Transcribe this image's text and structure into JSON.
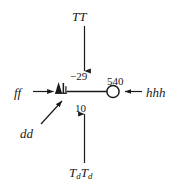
{
  "diagram": {
    "type": "signal-flow-block-diagram",
    "background_color": "#ffffff",
    "stroke_color": "#1a1a1a",
    "nodes": {
      "valve": {
        "name": "valve-symbol",
        "shape": "filled-triangle-with-bars",
        "x": 60,
        "y": 91
      },
      "summing_junction": {
        "name": "summing-junction",
        "shape": "open-circle",
        "x": 113,
        "y": 91,
        "radius": 6
      }
    },
    "labels": {
      "top_input": "TT",
      "left_input": "ff",
      "right_input": "hhh",
      "bottom_input_T": "T",
      "bottom_input_sub": "d",
      "diagonal_label": "dd"
    },
    "values": {
      "top_value": "−29",
      "bottom_value": "10",
      "node_value": "540"
    },
    "arrows": [
      {
        "name": "arrow-top-down",
        "from": "TT",
        "to": "main-line",
        "direction": "down"
      },
      {
        "name": "arrow-left-right",
        "from": "ff",
        "to": "valve",
        "direction": "right"
      },
      {
        "name": "arrow-right-left",
        "from": "hhh",
        "to": "summing-junction",
        "direction": "left"
      },
      {
        "name": "arrow-bottom-up",
        "from": "TdTd",
        "to": "main-line",
        "direction": "up"
      },
      {
        "name": "arrow-diagonal-up",
        "from": "dd",
        "to": "valve",
        "direction": "up-right"
      }
    ]
  }
}
